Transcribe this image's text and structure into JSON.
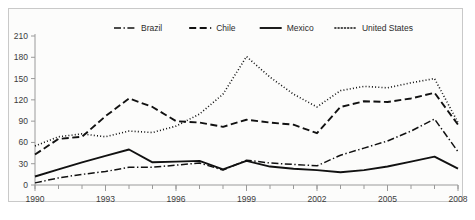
{
  "chart_data": {
    "type": "line",
    "title": "",
    "subtitle": "",
    "xlabel": "",
    "ylabel": "",
    "xlim": [
      1990,
      2008
    ],
    "ylim": [
      0,
      210
    ],
    "y_ticks": [
      0,
      30,
      60,
      90,
      120,
      150,
      180,
      210
    ],
    "x_ticks": [
      1990,
      1993,
      1996,
      1999,
      2002,
      2005,
      2008
    ],
    "x_tick_labels": [
      "1990",
      "1993",
      "1996",
      "1999",
      "2002",
      "2005",
      "2008"
    ],
    "y_tick_labels": [
      "0",
      "30",
      "60",
      "90",
      "120",
      "150",
      "180",
      "210"
    ],
    "x_minor_ticks": [
      1990,
      1991,
      1992,
      1993,
      1994,
      1995,
      1996,
      1997,
      1998,
      1999,
      2000,
      2001,
      2002,
      2003,
      2004,
      2005,
      2006,
      2007,
      2008
    ],
    "grid": false,
    "legend_position": "top-center",
    "x": [
      1990,
      1991,
      1992,
      1993,
      1994,
      1995,
      1996,
      1997,
      1998,
      1999,
      2000,
      2001,
      2002,
      2003,
      2004,
      2005,
      2006,
      2007,
      2008
    ],
    "series": [
      {
        "name": "Brazil",
        "line_style": "dash-dot",
        "color": "#111111",
        "values": [
          3,
          10,
          15,
          19,
          25,
          25,
          28,
          31,
          21,
          35,
          31,
          29,
          27,
          42,
          52,
          62,
          76,
          93,
          47
        ]
      },
      {
        "name": "Chile",
        "line_style": "dashed",
        "color": "#111111",
        "values": [
          43,
          65,
          68,
          97,
          122,
          110,
          90,
          88,
          82,
          92,
          88,
          85,
          73,
          110,
          118,
          117,
          122,
          130,
          85
        ]
      },
      {
        "name": "Mexico",
        "line_style": "solid",
        "color": "#111111",
        "values": [
          12,
          22,
          32,
          41,
          50,
          32,
          33,
          34,
          22,
          34,
          26,
          23,
          21,
          18,
          21,
          26,
          33,
          40,
          23
        ]
      },
      {
        "name": "United States",
        "line_style": "dotted",
        "color": "#111111",
        "values": [
          55,
          68,
          72,
          68,
          76,
          74,
          83,
          100,
          128,
          181,
          152,
          128,
          110,
          133,
          139,
          137,
          144,
          150,
          88
        ]
      }
    ],
    "legend": [
      {
        "label": "Brazil",
        "line_style": "dash-dot"
      },
      {
        "label": "Chile",
        "line_style": "dashed"
      },
      {
        "label": "Mexico",
        "line_style": "solid"
      },
      {
        "label": "United States",
        "line_style": "dotted"
      }
    ]
  }
}
